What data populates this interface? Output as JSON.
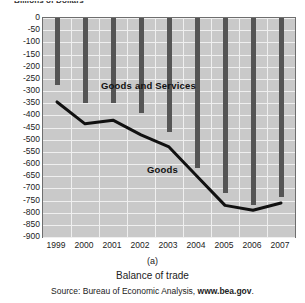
{
  "figure": {
    "y_axis_title": "Billions of Dollars",
    "panel_letter": "(a)",
    "caption_title": "Balance of trade",
    "source_prefix": "Source: Bureau of Economic Analysis, ",
    "source_site": "www.bea.gov",
    "source_suffix": "."
  },
  "labels": {
    "goods_and_services": "Goods and Services",
    "goods": "Goods"
  },
  "colors": {
    "plot_background": "#c9c9c9",
    "gridline": "#efefef",
    "bar": "#555555",
    "line": "#111111",
    "frame": "#6e6e6e"
  },
  "chart_data": {
    "type": "bar",
    "title": "Billions of Dollars",
    "subtitle": "Balance of trade",
    "xlabel": "",
    "ylabel": "Billions of Dollars",
    "ylim": [
      -900,
      0
    ],
    "ytick_labels": [
      "0",
      "-50",
      "-100",
      "-150",
      "-200",
      "-250",
      "-300",
      "-350",
      "-400",
      "-450",
      "-500",
      "-550",
      "-600",
      "-650",
      "-700",
      "-750",
      "-800",
      "-850",
      "-900"
    ],
    "ytick_values": [
      0,
      -50,
      -100,
      -150,
      -200,
      -250,
      -300,
      -350,
      -400,
      -450,
      -500,
      -550,
      -600,
      -650,
      -700,
      -750,
      -800,
      -850,
      -900
    ],
    "grid": true,
    "legend": "in-plot annotations",
    "categories": [
      "1999",
      "2000",
      "2001",
      "2002",
      "2003",
      "2004",
      "2005",
      "2006",
      "2007"
    ],
    "series": [
      {
        "name": "Goods and Services",
        "render": "bar",
        "values": [
          -275,
          -350,
          -350,
          -390,
          -470,
          -615,
          -720,
          -770,
          -735
        ]
      },
      {
        "name": "Goods",
        "render": "line",
        "values": [
          -345,
          -435,
          -420,
          -480,
          -530,
          -650,
          -770,
          -790,
          -760
        ]
      }
    ]
  }
}
